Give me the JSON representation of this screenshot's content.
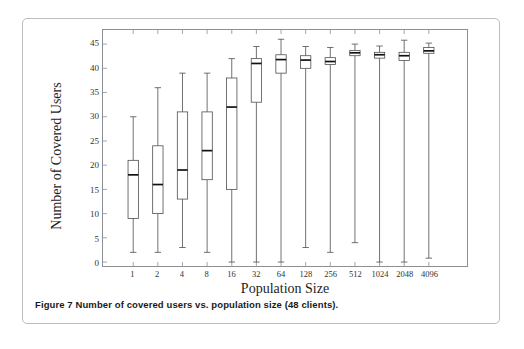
{
  "figure": {
    "caption": "Figure 7 Number of covered users vs. population size (48 clients)."
  },
  "chart_data": {
    "type": "box",
    "title": "",
    "xlabel": "Population Size",
    "ylabel": "Number of Covered Users",
    "categories": [
      "1",
      "2",
      "4",
      "8",
      "16",
      "32",
      "64",
      "128",
      "256",
      "512",
      "1024",
      "2048",
      "4096"
    ],
    "xtick_labels": [
      "1",
      "2",
      "4",
      "8",
      "16",
      "32",
      "64",
      "128",
      "256",
      "512",
      "1024",
      "2048",
      "4096"
    ],
    "ytick_labels": [
      "0",
      "5",
      "10",
      "15",
      "20",
      "25",
      "30",
      "35",
      "40",
      "45"
    ],
    "yticks": [
      0,
      5,
      10,
      15,
      20,
      25,
      30,
      35,
      40,
      45
    ],
    "ylim": [
      0,
      47.5
    ],
    "grid": false,
    "legend": null,
    "series": [
      {
        "name": "Number of Covered Users",
        "boxes": [
          {
            "category": "1",
            "whisker_low": 2,
            "q1": 9,
            "median": 18,
            "q3": 21,
            "whisker_high": 30
          },
          {
            "category": "2",
            "whisker_low": 2,
            "q1": 10,
            "median": 16,
            "q3": 24,
            "whisker_high": 36
          },
          {
            "category": "4",
            "whisker_low": 3,
            "q1": 13,
            "median": 19,
            "q3": 31,
            "whisker_high": 39
          },
          {
            "category": "8",
            "whisker_low": 2,
            "q1": 17,
            "median": 23,
            "q3": 31,
            "whisker_high": 39
          },
          {
            "category": "16",
            "whisker_low": 0,
            "q1": 15,
            "median": 32,
            "q3": 38,
            "whisker_high": 42
          },
          {
            "category": "32",
            "whisker_low": 0,
            "q1": 33,
            "median": 41,
            "q3": 42,
            "whisker_high": 44.5
          },
          {
            "category": "64",
            "whisker_low": 0,
            "q1": 39,
            "median": 41.8,
            "q3": 42.8,
            "whisker_high": 46
          },
          {
            "category": "128",
            "whisker_low": 3,
            "q1": 40,
            "median": 41.7,
            "q3": 42.6,
            "whisker_high": 44.5
          },
          {
            "category": "256",
            "whisker_low": 2,
            "q1": 40.8,
            "median": 41.4,
            "q3": 42.2,
            "whisker_high": 44.3
          },
          {
            "category": "512",
            "whisker_low": 4,
            "q1": 42.6,
            "median": 43.2,
            "q3": 43.7,
            "whisker_high": 45
          },
          {
            "category": "1024",
            "whisker_low": 0,
            "q1": 42.1,
            "median": 42.8,
            "q3": 43.3,
            "whisker_high": 44.6
          },
          {
            "category": "2048",
            "whisker_low": 0,
            "q1": 41.6,
            "median": 42.6,
            "q3": 43.3,
            "whisker_high": 45.8
          },
          {
            "category": "4096",
            "whisker_low": 0.8,
            "q1": 43.1,
            "median": 43.6,
            "q3": 44.3,
            "whisker_high": 45.2
          }
        ]
      }
    ],
    "colors": {
      "line": "#4d4d4d",
      "median": "#111111",
      "axis": "#8c8f93",
      "background": "#ffffff"
    }
  }
}
